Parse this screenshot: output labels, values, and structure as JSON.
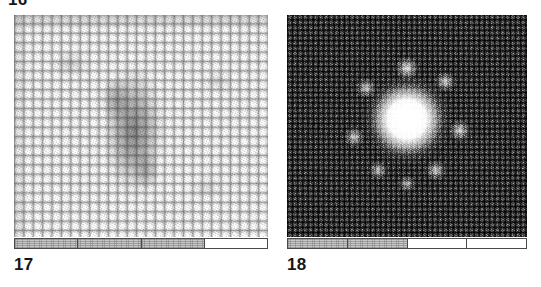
{
  "figure": {
    "top_cut_label": "16",
    "background_color": "#ffffff",
    "panels": [
      {
        "id": "panel-left",
        "caption": "17",
        "image_kind": "scanning-probe-micrograph",
        "description": "Bright square atomic lattice with a dark diffuse defect feature near the centre",
        "contrast_mode": "light-on-dark-grooves",
        "scalebar": {
          "segments": 4,
          "filled": [
            true,
            true,
            true,
            false
          ],
          "fill_color": "#c9c9c9",
          "border_color": "#4a4a4a"
        }
      },
      {
        "id": "panel-right",
        "caption": "18",
        "image_kind": "scanning-probe-micrograph",
        "description": "Dark fine-grained lattice with a bright star-shaped cluster at the centre",
        "contrast_mode": "dark-background-bright-cluster",
        "scalebar": {
          "segments": 4,
          "filled": [
            true,
            true,
            false,
            false
          ],
          "fill_color": "#c9c9c9",
          "border_color": "#4a4a4a"
        }
      }
    ]
  }
}
